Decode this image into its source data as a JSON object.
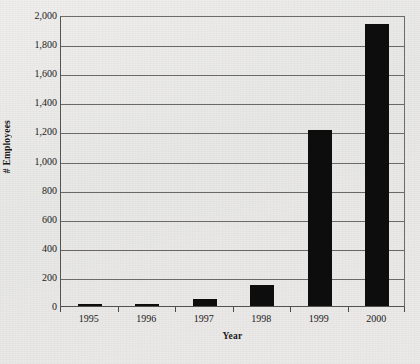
{
  "chart_data": {
    "type": "bar",
    "title": "",
    "xlabel": "Year",
    "ylabel": "# Employees",
    "categories": [
      "1995",
      "1996",
      "1997",
      "1998",
      "1999",
      "2000"
    ],
    "values": [
      10,
      12,
      45,
      145,
      1210,
      1935
    ],
    "ylim": [
      0,
      2000
    ],
    "y_tick_values": [
      0,
      200,
      400,
      600,
      800,
      1000,
      1200,
      1400,
      1600,
      1800,
      2000
    ],
    "y_tick_labels": [
      "0",
      "200",
      "400",
      "600",
      "800",
      "1,000",
      "1,200",
      "1,400",
      "1,600",
      "1,800",
      "2,000"
    ],
    "grid": "horizontal",
    "legend": "none",
    "bar_color": "#0d0d0d",
    "gridline_color": "#6a6964",
    "axis_color": "#54534f",
    "background_color": "#e9e9e7"
  },
  "axes": {
    "y_title": "# Employees",
    "x_title": "Year"
  }
}
